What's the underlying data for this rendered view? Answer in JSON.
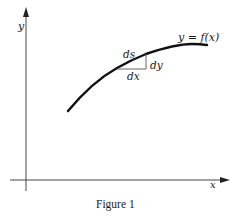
{
  "figure": {
    "caption": "Figure 1",
    "axes": {
      "x_label": "x",
      "y_label": "y"
    },
    "curve": {
      "label": "y = f(x)"
    },
    "differential_triangle": {
      "hypotenuse_label": "ds",
      "vertical_label": "dy",
      "horizontal_label": "dx"
    },
    "colors": {
      "ink": "#1a1a1a",
      "thin_line": "#555555",
      "background": "#ffffff"
    }
  }
}
